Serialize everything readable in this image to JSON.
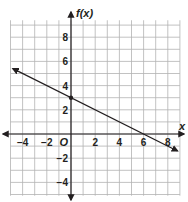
{
  "chart_data": {
    "type": "line",
    "title": "",
    "xlabel": "x",
    "ylabel": "f(x)",
    "origin_label": "O",
    "xlim": [
      -5,
      9
    ],
    "ylim": [
      -5,
      9
    ],
    "grid": true,
    "x_ticks": [
      -4,
      -2,
      2,
      4,
      6,
      8
    ],
    "y_ticks": [
      8,
      6,
      4,
      2,
      -2,
      -4
    ],
    "x_tick_labels": [
      "−4",
      "−2",
      "2",
      "4",
      "6",
      "8"
    ],
    "y_tick_labels": [
      "8",
      "6",
      "4",
      "2",
      "−2",
      "−4"
    ],
    "series": [
      {
        "name": "f(x)",
        "equation": "f(x) = -0.5x + 3",
        "slope": -0.5,
        "intercept": 3,
        "arrows": "both",
        "x": [
          -4.8,
          8.8
        ],
        "y": [
          5.4,
          -1.4
        ],
        "marked_points": [
          {
            "x": 0,
            "y": 3
          }
        ]
      }
    ],
    "colors": {
      "grid": "#b3b3b3",
      "axis": "#231f20",
      "line": "#231f20"
    }
  }
}
